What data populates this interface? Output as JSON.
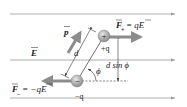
{
  "diagram": {
    "colors": {
      "field_line": "#9a9a9a",
      "force_arrow": "#8c8c8c",
      "dipole_arrow": "#8c8c8c",
      "charge_fill": "#b0b0b0",
      "text": "#222222"
    },
    "labels": {
      "field": "E",
      "dipole_moment": "p",
      "separation": "d",
      "positive_charge": "+q",
      "negative_charge": "−q",
      "angle": "ϕ",
      "lever_arm": "d sin ϕ",
      "force_positive_lhs": "F",
      "force_positive_sub": "+",
      "force_positive_rhs": "= qE",
      "force_negative_lhs": "F",
      "force_negative_sub": "−",
      "force_negative_rhs": "= −qE",
      "plus_symbol": "+",
      "minus_symbol": "−"
    }
  }
}
